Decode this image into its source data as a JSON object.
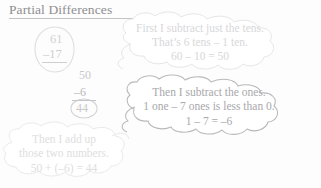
{
  "page": {
    "title": "Partial Differences",
    "background_color": "#fdfdfd",
    "title_color": "#8e8e90"
  },
  "problem": {
    "minuend": "61",
    "subtrahend": "–17",
    "partial_tens": "50",
    "partial_ones": "–6",
    "answer": "44"
  },
  "bubbles": [
    {
      "name": "tens-step-bubble",
      "line1": "First I subtract just the tens.",
      "line2": "That’s 6 tens – 1 ten.",
      "line3": "60 – 10 = 50",
      "outline_color": "#e3e3e5",
      "text_color": "#d8d8da"
    },
    {
      "name": "ones-step-bubble",
      "line1": "Then I subtract the ones.",
      "line2": "1 one – 7 ones is less than 0.",
      "line3": "1 – 7 = –6",
      "outline_color": "#b5b5b9",
      "text_color": "#a8a8ac"
    },
    {
      "name": "sum-step-bubble",
      "line1": "Then I add up",
      "line2": "those two numbers.",
      "line3": "50 + (–6) = 44",
      "outline_color": "#e8e8ea",
      "text_color": "#dedee0"
    }
  ],
  "shapes": {
    "problem_oval_name": "problem-oval",
    "answer_circle_name": "answer-circle",
    "title_underline_name": "title-underline"
  }
}
